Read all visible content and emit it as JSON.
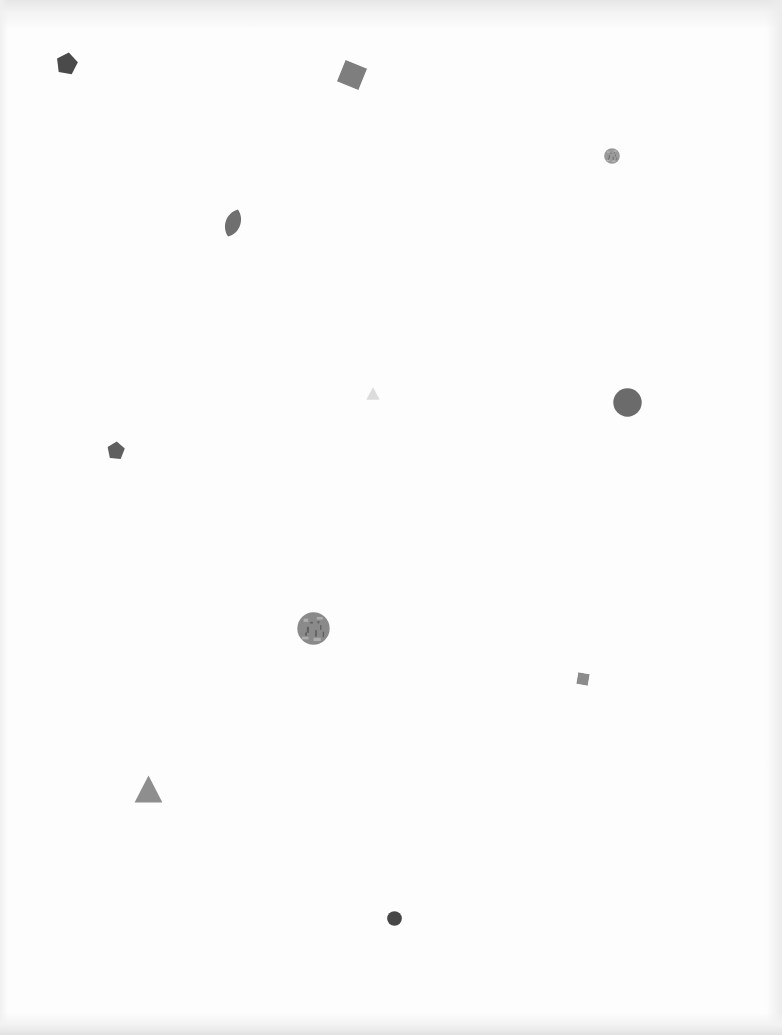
{
  "page": {
    "background": "#fdfdfd",
    "shapes": [
      {
        "id": "pentagon-1",
        "type": "pentagon",
        "x": 56,
        "y": 52,
        "w": 22,
        "h": 22,
        "rotate": 10,
        "color": "#4a4a4a"
      },
      {
        "id": "square-1",
        "type": "square",
        "x": 340,
        "y": 63,
        "w": 24,
        "h": 24,
        "rotate": 22,
        "color": "#7e7e7e"
      },
      {
        "id": "circle-1",
        "type": "circle",
        "x": 604,
        "y": 148,
        "w": 16,
        "h": 16,
        "rotate": 0,
        "color": "#9a9a9a",
        "textured": true
      },
      {
        "id": "leaf-1",
        "type": "leaf",
        "x": 222,
        "y": 208,
        "w": 22,
        "h": 30,
        "rotate": 20,
        "color": "#6f6f6f"
      },
      {
        "id": "triangle-1",
        "type": "triangle",
        "x": 366,
        "y": 387,
        "w": 14,
        "h": 13,
        "rotate": 0,
        "color": "#dcdcdc"
      },
      {
        "id": "circle-2",
        "type": "circle",
        "x": 613,
        "y": 388,
        "w": 29,
        "h": 29,
        "rotate": 0,
        "color": "#6b6b6b"
      },
      {
        "id": "pentagon-2",
        "type": "pentagon",
        "x": 107,
        "y": 441,
        "w": 18,
        "h": 18,
        "rotate": 5,
        "color": "#5f5f5f"
      },
      {
        "id": "circle-3",
        "type": "circle",
        "x": 297,
        "y": 612,
        "w": 33,
        "h": 33,
        "rotate": 0,
        "color": "#8a8a8a",
        "textured": true
      },
      {
        "id": "square-2",
        "type": "square",
        "x": 577,
        "y": 673,
        "w": 12,
        "h": 12,
        "rotate": 10,
        "color": "#8c8c8c"
      },
      {
        "id": "triangle-2",
        "type": "triangle",
        "x": 134,
        "y": 775,
        "w": 29,
        "h": 28,
        "rotate": 0,
        "color": "#8e8e8e"
      },
      {
        "id": "circle-4",
        "type": "circle",
        "x": 387,
        "y": 911,
        "w": 15,
        "h": 15,
        "rotate": 0,
        "color": "#474747"
      }
    ]
  }
}
